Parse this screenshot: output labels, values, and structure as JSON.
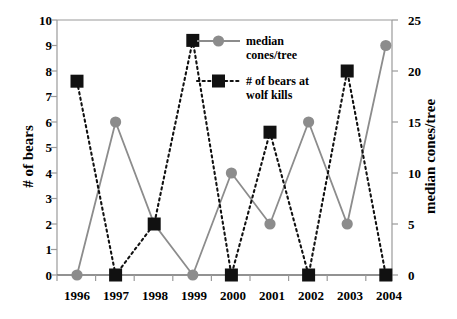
{
  "chart_data": {
    "type": "line",
    "title": "",
    "xlabel": "",
    "ylabel": "# of bears",
    "y2label": "median cones/tree",
    "categories": [
      "1996",
      "1997",
      "1998",
      "1999",
      "2000",
      "2001",
      "2002",
      "2003",
      "2004"
    ],
    "x": [
      1996,
      1997,
      1998,
      1999,
      2000,
      2001,
      2002,
      2003,
      2004
    ],
    "ylim": [
      0,
      10
    ],
    "yticks": [
      0,
      1,
      2,
      3,
      4,
      5,
      6,
      7,
      8,
      9,
      10
    ],
    "y2lim": [
      0,
      25
    ],
    "y2ticks": [
      0,
      5,
      10,
      15,
      20,
      25
    ],
    "grid": false,
    "legend_position": "upper-center",
    "series": [
      {
        "name": "median cones/tree",
        "axis": "right",
        "marker": "circle",
        "linestyle": "solid",
        "color": "#8c8c8c",
        "values": [
          0,
          15,
          5,
          0,
          10,
          5,
          15,
          5,
          22.5
        ],
        "values_left_axis_equivalent": [
          0,
          6,
          2,
          0,
          4,
          2,
          6,
          2,
          9
        ]
      },
      {
        "name": "# of bears at wolf kills",
        "axis": "left",
        "marker": "square",
        "linestyle": "dotted",
        "color": "#111111",
        "values": [
          7.6,
          0,
          2,
          9.2,
          0,
          5.6,
          0,
          8,
          0
        ]
      }
    ]
  },
  "axes": {
    "left_title": "# of bears",
    "right_title": "median cones/tree",
    "left_ticks": [
      "0",
      "1",
      "2",
      "3",
      "4",
      "5",
      "6",
      "7",
      "8",
      "9",
      "10"
    ],
    "right_ticks": [
      "0",
      "5",
      "10",
      "15",
      "20",
      "25"
    ],
    "x_ticks": [
      "1996",
      "1997",
      "1998",
      "1999",
      "2000",
      "2001",
      "2002",
      "2003",
      "2004"
    ]
  },
  "legend": {
    "entries": [
      {
        "label_line1": "median",
        "label_line2": "cones/tree",
        "marker": "circle-marker",
        "color": "#8c8c8c"
      },
      {
        "label_line1": "# of bears at",
        "label_line2": "wolf kills",
        "marker": "square-marker",
        "color": "#111111"
      }
    ]
  },
  "colors": {
    "cones_series": "#8c8c8c",
    "bears_series": "#111111",
    "axis": "#808080",
    "text": "#000000",
    "background": "#ffffff"
  }
}
